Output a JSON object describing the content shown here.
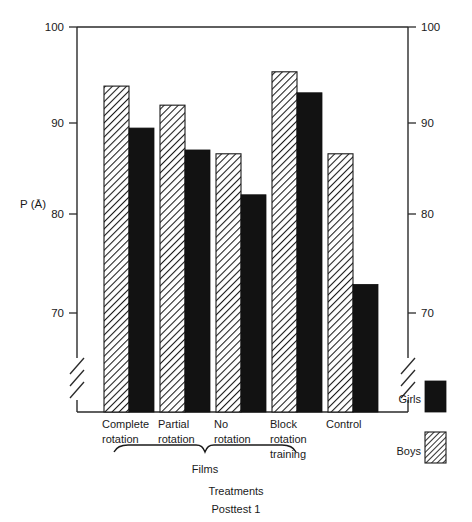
{
  "chart_data": {
    "type": "bar",
    "title": "",
    "subtitle": "",
    "xlabel": "Treatments",
    "caption": "Posttest 1",
    "ylabel": "P (Ā)",
    "ylim": [
      70,
      100
    ],
    "yticks": [
      70,
      80,
      90,
      100
    ],
    "ytick_labels": [
      "70",
      "80",
      "90",
      "100"
    ],
    "axis_break": true,
    "axis_break_note": "broken y-axis below 70",
    "grid": false,
    "dual_y_axis": true,
    "right_ytick_labels": [
      "70",
      "80",
      "90",
      "100"
    ],
    "legend_position": "right",
    "categories": [
      "Complete rotation",
      "Partial rotation",
      "No rotation",
      "Block rotation training",
      "Control"
    ],
    "category_lines": [
      [
        "Complete",
        "rotation"
      ],
      [
        "Partial",
        "rotation"
      ],
      [
        "No",
        "rotation"
      ],
      [
        "Block",
        "rotation",
        "training"
      ],
      [
        "Control"
      ]
    ],
    "group_bracket": {
      "label": "Films",
      "spans_categories": [
        "Complete rotation",
        "Partial rotation",
        "No rotation"
      ]
    },
    "series": [
      {
        "name": "Boys",
        "fill": "hatched",
        "color": "#ffffff",
        "values": [
          93.8,
          91.8,
          86.7,
          95.3,
          86.7
        ]
      },
      {
        "name": "Girls",
        "fill": "solid",
        "color": "#121212",
        "values": [
          89.4,
          87.1,
          82.4,
          93.1,
          73.0
        ]
      }
    ]
  },
  "chart": {
    "ylabel": "P (Ā)",
    "xlabel": "Treatments",
    "caption": "Posttest 1",
    "bracket_label": "Films",
    "yticks": [
      "100",
      "90",
      "80",
      "70"
    ],
    "right_yticks": [
      "100",
      "90",
      "80",
      "70"
    ]
  },
  "legend": {
    "items": [
      {
        "label": "Girls",
        "swatch": "solid-black"
      },
      {
        "label": "Boys",
        "swatch": "hatched"
      }
    ]
  }
}
